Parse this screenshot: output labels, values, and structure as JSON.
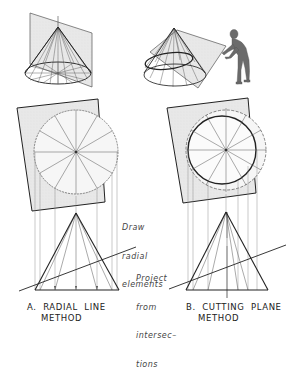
{
  "figure": {
    "annotations": {
      "draw_radial": [
        "Draw",
        "radial",
        "elements"
      ],
      "project": [
        "Project",
        "from",
        "intersec–",
        "tions"
      ]
    },
    "captions": {
      "a_line1": "A.  RADIAL  LINE",
      "a_line2": "METHOD",
      "b_line1": "B.  CUTTING  PLANE",
      "b_line2": "METHOD"
    },
    "colors": {
      "line": "#333333",
      "plane_fill": "#e6e6e6",
      "figure_fill": "#6a6a6a",
      "background": "#ffffff"
    }
  }
}
